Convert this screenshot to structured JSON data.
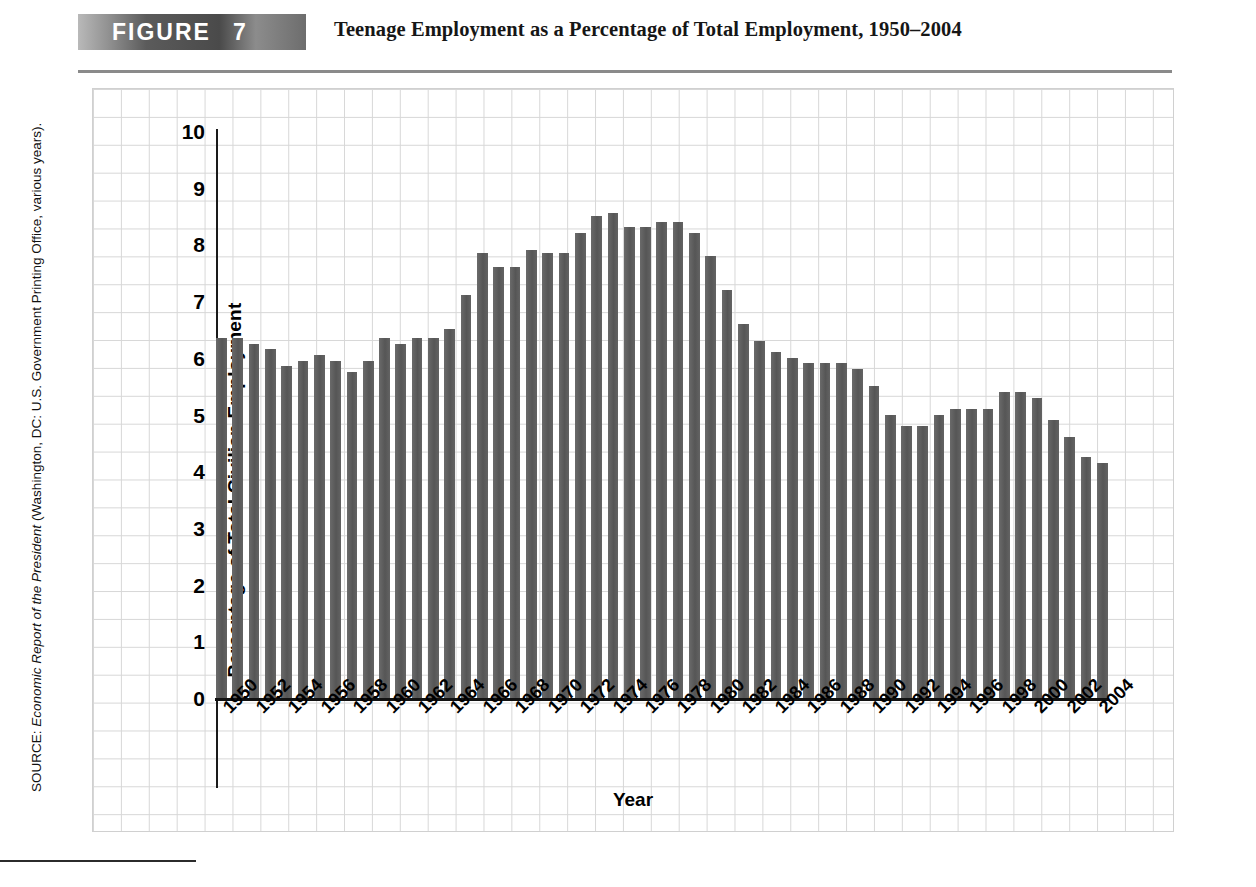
{
  "header": {
    "figure_word": "FIGURE",
    "figure_number": "7",
    "title": "Teenage Employment as a Percentage of Total Employment, 1950–2004"
  },
  "source": {
    "prefix": "SOURCE: ",
    "italic": "Economic Report of the President",
    "suffix": " (Washington, DC: U.S. Government Printing Office, various years)."
  },
  "chart_data": {
    "type": "bar",
    "title": "Teenage Employment as a Percentage of Total Employment, 1950–2004",
    "xlabel": "Year",
    "ylabel": "Percentage of Total Civilian Employment",
    "ylim": [
      0,
      10
    ],
    "yticks": [
      "0",
      "1",
      "2",
      "3",
      "4",
      "5",
      "6",
      "7",
      "8",
      "9",
      "10"
    ],
    "grid": true,
    "legend": "none",
    "bar_color": "#5e5e5e",
    "tick_label_step": 2,
    "categories": [
      "1950",
      "1951",
      "1952",
      "1953",
      "1954",
      "1955",
      "1956",
      "1957",
      "1958",
      "1959",
      "1960",
      "1961",
      "1962",
      "1963",
      "1964",
      "1965",
      "1966",
      "1967",
      "1968",
      "1969",
      "1970",
      "1971",
      "1972",
      "1973",
      "1974",
      "1975",
      "1976",
      "1977",
      "1978",
      "1979",
      "1980",
      "1981",
      "1982",
      "1983",
      "1984",
      "1985",
      "1986",
      "1987",
      "1988",
      "1989",
      "1990",
      "1991",
      "1992",
      "1993",
      "1994",
      "1995",
      "1996",
      "1997",
      "1998",
      "1999",
      "2000",
      "2001",
      "2002",
      "2003",
      "2004"
    ],
    "values": [
      6.35,
      6.35,
      6.25,
      6.15,
      5.85,
      5.95,
      6.05,
      5.95,
      5.75,
      5.95,
      6.35,
      6.25,
      6.35,
      6.35,
      6.5,
      7.1,
      7.85,
      7.6,
      7.6,
      7.9,
      7.85,
      7.85,
      8.2,
      8.5,
      8.55,
      8.3,
      8.3,
      8.4,
      8.4,
      8.2,
      7.8,
      7.2,
      6.6,
      6.3,
      6.1,
      6.0,
      5.9,
      5.9,
      5.9,
      5.8,
      5.5,
      5.0,
      4.8,
      4.8,
      5.0,
      5.1,
      5.1,
      5.1,
      5.4,
      5.4,
      5.3,
      4.9,
      4.6,
      4.25,
      4.15
    ],
    "displayed_tick_labels": [
      "1950",
      "1952",
      "1954",
      "1956",
      "1958",
      "1960",
      "1962",
      "1964",
      "1966",
      "1968",
      "1970",
      "1972",
      "1974",
      "1976",
      "1978",
      "1980",
      "1982",
      "1984",
      "1986",
      "1988",
      "1990",
      "1992",
      "1994",
      "1996",
      "1998",
      "2000",
      "2002",
      "2004"
    ]
  }
}
